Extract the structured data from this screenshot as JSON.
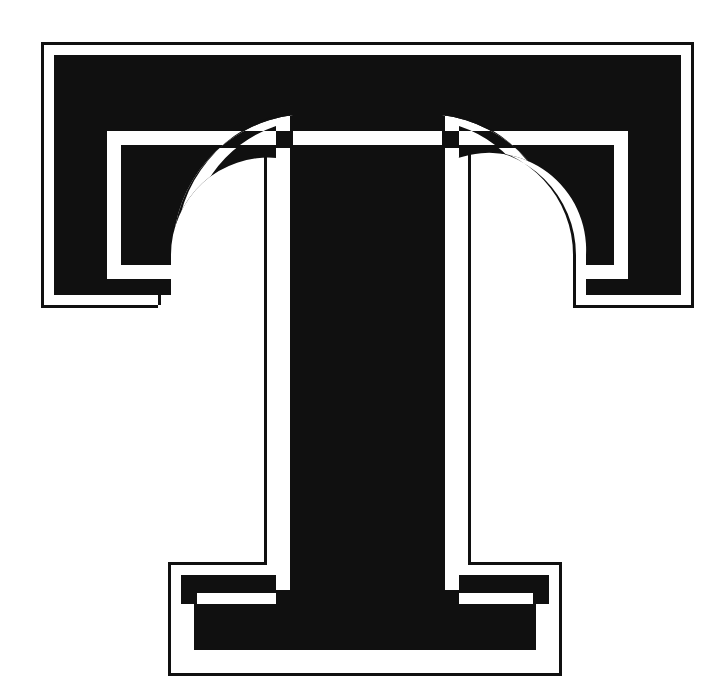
{
  "page": {
    "width": 705,
    "height": 699,
    "background_color": "#ffffff"
  },
  "glyph": {
    "character": "T",
    "name": "latin-capital-letter-t",
    "description": "Ornamental slab-serif capital letter T with an inline white channel",
    "style": "slab-serif inline / shaded-outline display letter",
    "ink_color": "#101010",
    "paper_color": "#ffffff",
    "channel_color": "#ffffff",
    "outer_stroke_width": 3,
    "outer_white_band_width": 10,
    "inner_channel_width": 14,
    "inner_stroke_width": 3,
    "bounds": {
      "left": 41,
      "top": 42,
      "right": 694,
      "bottom": 676,
      "width": 653,
      "height": 634
    },
    "metrics": {
      "arm_bottom_y": 308,
      "stem_left_x": 264,
      "stem_right_x": 471,
      "stem_width": 207,
      "foot_left_x": 168,
      "foot_right_x": 562,
      "foot_top_y": 562,
      "bracket_radius_top": 110,
      "bracket_radius_foot": 50
    }
  },
  "layers": [
    {
      "id": "outer-stroke",
      "label": "Outer contour stroke",
      "color": "#101010"
    },
    {
      "id": "outer-band",
      "label": "Outer white band",
      "color": "#ffffff"
    },
    {
      "id": "body-fill",
      "label": "Solid black body",
      "color": "#101010"
    },
    {
      "id": "inline-channel",
      "label": "Inline white channel",
      "color": "#ffffff"
    },
    {
      "id": "inline-stroke",
      "label": "Inline channel stroke",
      "color": "#101010"
    }
  ]
}
